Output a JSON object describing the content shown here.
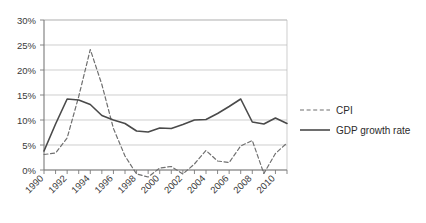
{
  "chart_data": {
    "type": "line",
    "title": "",
    "subtitle": "",
    "xlabel": "",
    "ylabel": "",
    "ylim": [
      0,
      30
    ],
    "ytick_values": [
      0,
      5,
      10,
      15,
      20,
      25,
      30
    ],
    "ytick_labels": [
      "0%",
      "5%",
      "10%",
      "15%",
      "20%",
      "25%",
      "30%"
    ],
    "xlim": [
      1990,
      2011
    ],
    "x": [
      1990,
      1991,
      1992,
      1993,
      1994,
      1995,
      1996,
      1997,
      1998,
      1999,
      2000,
      2001,
      2002,
      2003,
      2004,
      2005,
      2006,
      2007,
      2008,
      2009,
      2010,
      2011
    ],
    "xtick_labels": [
      "1990",
      "1992",
      "1994",
      "1996",
      "1998",
      "2000",
      "2002",
      "2004",
      "2006",
      "2008",
      "2010"
    ],
    "xtick_label_values": [
      1990,
      1992,
      1994,
      1996,
      1998,
      2000,
      2002,
      2004,
      2006,
      2008,
      2010
    ],
    "grid": true,
    "grid_axis": "y",
    "legend_position": "right",
    "series": [
      {
        "name": "CPI",
        "style": "dashed",
        "color": "#6f6f6f",
        "values": [
          3.1,
          3.4,
          6.4,
          14.7,
          24.1,
          17.1,
          8.3,
          2.8,
          -0.8,
          -1.4,
          0.4,
          0.7,
          -0.8,
          1.2,
          3.9,
          1.8,
          1.5,
          4.8,
          5.9,
          -0.7,
          3.3,
          5.4
        ]
      },
      {
        "name": "GDP growth rate",
        "style": "solid",
        "color": "#4a4a4a",
        "values": [
          3.8,
          9.2,
          14.2,
          14.0,
          13.1,
          10.9,
          10.0,
          9.3,
          7.8,
          7.6,
          8.4,
          8.3,
          9.1,
          10.0,
          10.1,
          11.3,
          12.7,
          14.2,
          9.6,
          9.2,
          10.4,
          9.3
        ]
      }
    ]
  },
  "legend": {
    "items": [
      {
        "label": "CPI",
        "style": "dashed"
      },
      {
        "label": "GDP growth rate",
        "style": "solid"
      }
    ]
  },
  "layout": {
    "plot_left": 44,
    "plot_right": 287,
    "plot_top": 20,
    "plot_bottom": 170,
    "legend_x": 300,
    "legend_cpi_y": 110,
    "legend_gdp_y": 130
  },
  "colors": {
    "background": "#ffffff",
    "grid": "#b9b9b9",
    "axis": "#7a7a7a",
    "cpi": "#6f6f6f",
    "gdp": "#4a4a4a",
    "text": "#2b2b2b"
  }
}
